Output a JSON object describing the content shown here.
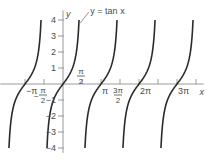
{
  "chart_data": {
    "type": "line",
    "title": "",
    "function": "tan x",
    "curve_label": "y = tan x",
    "xlabel": "x",
    "ylabel": "y",
    "xlim_pi": [
      -1.65,
      3.7
    ],
    "ylim": [
      -4.3,
      4.6
    ],
    "y_ticks": [
      {
        "value": 4,
        "label": "4"
      },
      {
        "value": 3,
        "label": "3"
      },
      {
        "value": 2,
        "label": "2"
      },
      {
        "value": 1,
        "label": "1"
      },
      {
        "value": -1,
        "label": "−1"
      },
      {
        "value": -2,
        "label": "−2"
      },
      {
        "value": -3,
        "label": "−3"
      },
      {
        "value": -4,
        "label": "−4"
      }
    ],
    "x_ticks_pi": [
      -1,
      -0.5,
      0.5,
      1,
      1.5,
      2,
      2.5,
      3,
      3.5
    ],
    "x_tick_labels": [
      {
        "value_pi": -1,
        "label": "−π",
        "type": "plain"
      },
      {
        "value_pi": -0.5,
        "num": "π",
        "den": "2",
        "sign": "−",
        "type": "frac"
      },
      {
        "value_pi": 0.5,
        "num": "π",
        "den": "2",
        "sign": "",
        "type": "frac"
      },
      {
        "value_pi": 1,
        "label": "π",
        "type": "plain"
      },
      {
        "value_pi": 1.5,
        "num": "3π",
        "den": "2",
        "sign": "",
        "type": "frac"
      },
      {
        "value_pi": 2,
        "label": "2π",
        "type": "plain"
      },
      {
        "value_pi": 3,
        "label": "3π",
        "type": "plain"
      }
    ],
    "branch_centers_pi": [
      -1,
      0,
      1,
      2,
      3
    ],
    "branch_y_range": [
      -4,
      4
    ],
    "grid": false,
    "legend": "none"
  }
}
